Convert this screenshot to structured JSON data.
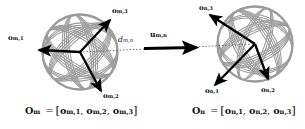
{
  "figure": {
    "background_color": "#ffffff",
    "wireframe_color": "#9a9a9a",
    "arrow_color": "#000000",
    "dashed_line_color": "#555555",
    "width": 305,
    "height": 129
  },
  "left_frame": {
    "name": "O_m",
    "center": {
      "x": 80,
      "y": 52
    },
    "radius": 38,
    "axes": [
      {
        "id": "o_m_1",
        "base": "o",
        "sub": "m,1",
        "label_x": 10,
        "label_y": 36,
        "tip_x": 36,
        "tip_y": 50
      },
      {
        "id": "o_m_2",
        "base": "o",
        "sub": "m,2",
        "label_x": 104,
        "label_y": 95,
        "tip_x": 102,
        "tip_y": 93
      },
      {
        "id": "o_m_3",
        "base": "o",
        "sub": "m,3",
        "label_x": 114,
        "label_y": 9,
        "tip_x": 111,
        "tip_y": 18
      }
    ],
    "equation": {
      "symbol": "O",
      "symbol_sub": "m",
      "equals": "=",
      "open_bracket": "[",
      "components": [
        {
          "base": "o",
          "sub": "m,1"
        },
        {
          "base": "o",
          "sub": "m,2"
        },
        {
          "base": "o",
          "sub": "m,3"
        }
      ],
      "separator": ",",
      "close_bracket": "]",
      "x": 25,
      "y": 108
    }
  },
  "right_frame": {
    "name": "O_n",
    "center": {
      "x": 255,
      "y": 44
    },
    "radius": 38,
    "axes": [
      {
        "id": "o_n_1",
        "base": "o",
        "sub": "n,1",
        "label_x": 206,
        "label_y": 89,
        "tip_x": 216,
        "tip_y": 84
      },
      {
        "id": "o_n_2",
        "base": "o",
        "sub": "n,2",
        "label_x": 262,
        "label_y": 88,
        "tip_x": 266,
        "tip_y": 78
      },
      {
        "id": "o_n_3",
        "base": "o",
        "sub": "n,3",
        "label_x": 200,
        "label_y": 6,
        "tip_x": 209,
        "tip_y": 14
      }
    ],
    "equation": {
      "symbol": "O",
      "symbol_sub": "n",
      "equals": "=",
      "open_bracket": "[",
      "components": [
        {
          "base": "o",
          "sub": "n,1"
        },
        {
          "base": "o",
          "sub": "n,2"
        },
        {
          "base": "o",
          "sub": "n,3"
        }
      ],
      "separator": ",",
      "close_bracket": "]",
      "x": 192,
      "y": 108
    }
  },
  "connector": {
    "distance_label": {
      "base": "d",
      "sub": "m,n",
      "x": 119,
      "y": 38
    },
    "direction_label": {
      "base": "u",
      "sub": "m,n",
      "x": 151,
      "y": 33
    },
    "arrow_start": {
      "x": 144,
      "y": 48
    },
    "arrow_end": {
      "x": 199,
      "y": 47
    }
  }
}
